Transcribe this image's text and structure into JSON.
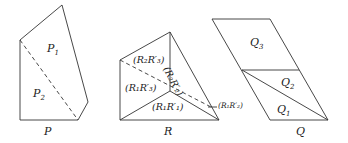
{
  "figures": [
    {
      "id": "P",
      "caption": "P",
      "regions": [
        {
          "label_main": "P",
          "label_sub": "1"
        },
        {
          "label_main": "P",
          "label_sub": "2"
        }
      ]
    },
    {
      "id": "R",
      "caption": "R",
      "regions": [
        {
          "text": "(R₂R′₃)"
        },
        {
          "text": "(R₂R′₂)"
        },
        {
          "text": "(R₁R′₃)"
        },
        {
          "text": "(R₁R′₁)"
        },
        {
          "text": "(R₁R′₂)"
        }
      ]
    },
    {
      "id": "Q",
      "caption": "Q",
      "regions": [
        {
          "label_main": "Q",
          "label_sub": "3"
        },
        {
          "label_main": "Q",
          "label_sub": "2"
        },
        {
          "label_main": "Q",
          "label_sub": "1"
        }
      ]
    }
  ],
  "colors": {
    "line": "#333333",
    "text": "#222222",
    "background": "#ffffff"
  }
}
